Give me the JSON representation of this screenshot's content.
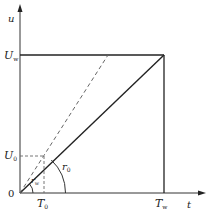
{
  "diagram": {
    "type": "ramp-voltage-time-graph",
    "axes": {
      "y_label": "u",
      "x_label": "t",
      "origin_label": "0"
    },
    "labels": {
      "U_w": {
        "main": "U",
        "sub": "w"
      },
      "U_0": {
        "main": "U",
        "sub": "0"
      },
      "T_0": {
        "main": "T",
        "sub": "0"
      },
      "T_w": {
        "main": "T",
        "sub": "w"
      },
      "r_0": {
        "main": "r",
        "sub": "0"
      },
      "r_w": {
        "main": "r",
        "sub": "w"
      }
    },
    "colors": {
      "line": "#222222",
      "dashed": "#555555",
      "background": "#ffffff"
    }
  }
}
